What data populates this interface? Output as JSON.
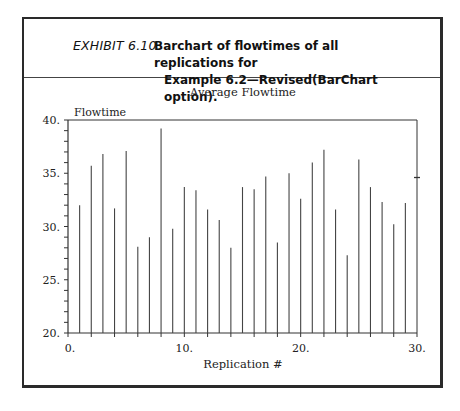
{
  "header": {
    "exhibit_label": "EXHIBIT 6.10",
    "caption_line1": "Barchart of flowtimes of all replications for",
    "caption_line2": "Example 6.2—Revised(BarChart option)."
  },
  "chart_data": {
    "type": "bar",
    "title": "Average Flowtime",
    "xlabel": "Replication #",
    "ylabel": "Flowtime",
    "xlim": [
      0,
      30
    ],
    "ylim": [
      20,
      40
    ],
    "x_tick_labels": [
      "0.",
      "10.",
      "20.",
      "30."
    ],
    "y_tick_labels": [
      "20.",
      "25.",
      "30.",
      "35.",
      "40."
    ],
    "grid": false,
    "legend": null,
    "categories": [
      1,
      2,
      3,
      4,
      5,
      6,
      7,
      8,
      9,
      10,
      11,
      12,
      13,
      14,
      15,
      16,
      17,
      18,
      19,
      20,
      21,
      22,
      23,
      24,
      25,
      26,
      27,
      28,
      29
    ],
    "values": [
      32.0,
      35.7,
      36.8,
      31.7,
      37.1,
      28.1,
      29.0,
      39.2,
      29.8,
      33.7,
      33.4,
      31.6,
      30.6,
      28.0,
      33.7,
      33.5,
      34.7,
      28.5,
      35.0,
      32.6,
      36.0,
      37.2,
      31.6,
      27.3,
      36.3,
      33.7,
      32.3,
      30.2,
      32.2
    ],
    "right_edge_marker": {
      "x": 30,
      "y": 34.6
    }
  }
}
